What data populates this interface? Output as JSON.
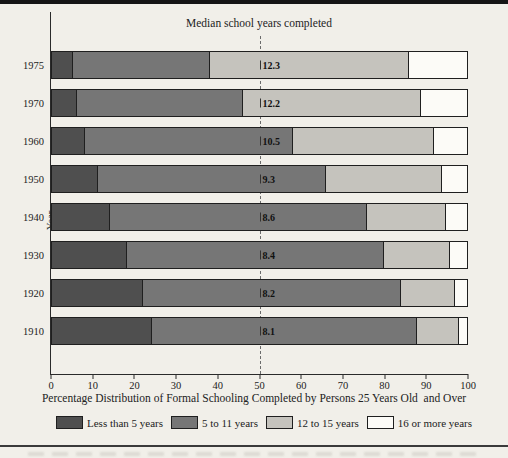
{
  "page": {
    "title": "Median school years completed",
    "ylabel": "Year",
    "caption": "Percentage Distribution of Formal Schooling Completed by Persons 25 Years Old  and Over"
  },
  "colors": {
    "less_than_5_years": "#4f4f4f",
    "5_to_11_years": "#767676",
    "12_to_15_years": "#c5c3bd",
    "16_or_more_years": "#fcfbf7",
    "background": "#f1efe9",
    "bar_border": "#1f1f1f",
    "median_dash_line": "#6b6b6b"
  },
  "legend": {
    "items": [
      {
        "label": "Less than 5 years",
        "color": "#4f4f4f"
      },
      {
        "label": "5 to 11 years",
        "color": "#767676"
      },
      {
        "label": "12 to 15 years",
        "color": "#c5c3bd"
      },
      {
        "label": "16 or more years",
        "color": "#fcfbf7"
      }
    ]
  },
  "chart_data": {
    "type": "bar",
    "orientation": "horizontal",
    "stacked": true,
    "title": "Median school years completed",
    "xlabel": "Percentage Distribution of Formal Schooling Completed by Persons 25 Years Old  and Over",
    "ylabel": "Year",
    "xlim": [
      0,
      100
    ],
    "x_ticks": [
      0,
      10,
      20,
      30,
      40,
      50,
      60,
      70,
      80,
      90,
      100
    ],
    "grid": false,
    "legend_position": "bottom",
    "median_line_x": 50,
    "categories": [
      "1975",
      "1970",
      "1960",
      "1950",
      "1940",
      "1930",
      "1920",
      "1910"
    ],
    "series": [
      {
        "name": "Less than 5 years",
        "values": [
          5,
          6,
          8,
          11,
          14,
          18,
          22,
          24
        ]
      },
      {
        "name": "5 to 11 years",
        "values": [
          33,
          40,
          50,
          55,
          62,
          62,
          62,
          64
        ]
      },
      {
        "name": "12 to 15 years",
        "values": [
          48,
          43,
          34,
          28,
          19,
          16,
          13,
          10
        ]
      },
      {
        "name": "16 or more years",
        "values": [
          14,
          11,
          8,
          6,
          5,
          4,
          3,
          2
        ]
      }
    ],
    "median_values": [
      "12.3",
      "12.2",
      "10.5",
      "9.3",
      "8.6",
      "8.4",
      "8.2",
      "8.1"
    ]
  }
}
